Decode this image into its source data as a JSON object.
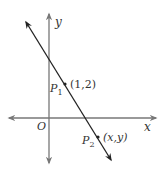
{
  "diagram": {
    "type": "coordinate-plane-line",
    "axes": {
      "x_label": "x",
      "y_label": "y",
      "origin_label": "O",
      "axis_color": "#777777"
    },
    "line": {
      "color": "#222222",
      "direction": "decreasing (top-left to bottom-right)"
    },
    "points": [
      {
        "name": "P",
        "subscript": "1",
        "coords_label": "(1,2)"
      },
      {
        "name": "P",
        "subscript": "2",
        "coords_label": "(x,y)"
      }
    ]
  }
}
